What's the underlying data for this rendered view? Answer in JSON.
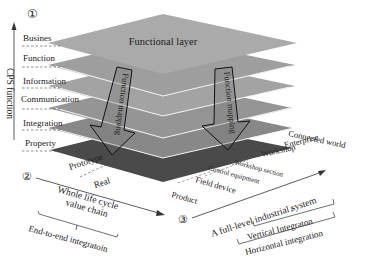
{
  "axis1": {
    "marker": "①",
    "title": "CPS function",
    "layers": [
      "Busines",
      "Function",
      "Information",
      "Communication",
      "Integration",
      "Property"
    ]
  },
  "stack": {
    "top_label": "Functional layer",
    "colors": [
      "#a9a9a9",
      "#9c9c9c",
      "#a3a3a3",
      "#969696",
      "#8a8a8a",
      "#555555"
    ],
    "arrow_left": "Function mapping",
    "arrow_right": "Function mapping"
  },
  "axis2": {
    "marker": "②",
    "items": [
      "Prototype",
      "Real"
    ],
    "chain_label": "Whole life cycle",
    "chain_label2": "value chain",
    "bracket_label": "End-to-end integratoin"
  },
  "axis3": {
    "marker": "③",
    "levels": [
      "Product",
      "Field device",
      "Control equipment",
      "Workshop section",
      "Workshop",
      "Enterprise",
      "Connected world"
    ],
    "system_label": "A full-level industrial system",
    "vertical_label": "Vertical Integraton",
    "horizontal_label": "Horizontal integration"
  }
}
